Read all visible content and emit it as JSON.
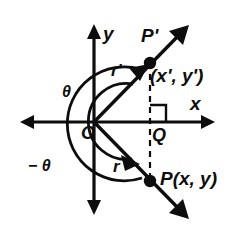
{
  "figure": {
    "background_color": "#ffffff",
    "ink_color": "#0d0d0d",
    "axes": {
      "x_label": "x",
      "y_label": "y",
      "origin_label": "O"
    },
    "points": [
      {
        "id": "p-prime",
        "point_label": "P'",
        "coord_label": "(x', y')",
        "dot": true
      },
      {
        "id": "p",
        "point_label": "P(x, y)",
        "coord_label": "",
        "dot": true
      },
      {
        "id": "foot",
        "point_label": "Q",
        "coord_label": "",
        "dot": false
      }
    ],
    "segments": [
      {
        "id": "r-prime",
        "label": "r'"
      },
      {
        "id": "r",
        "label": "r"
      }
    ],
    "angles": [
      {
        "id": "theta-positive",
        "label": "θ",
        "direction": "counterclockwise"
      },
      {
        "id": "theta-negative",
        "label": "− θ",
        "direction": "clockwise"
      }
    ],
    "markers": {
      "right_angle": "right-angle-square",
      "dashed_line": "perpendicular-dashed-segment"
    }
  }
}
